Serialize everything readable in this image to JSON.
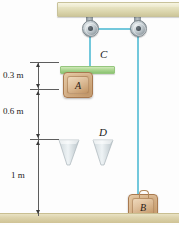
{
  "figure": {
    "domain": "physics-diagram"
  },
  "labels": {
    "block_a": "A",
    "block_b": "B",
    "platform_c": "C",
    "cone_d": "D"
  },
  "dimensions": [
    {
      "id": "d1",
      "text": "0.3 m",
      "value": 0.3,
      "unit": "m"
    },
    {
      "id": "d2",
      "text": "0.6 m",
      "value": 0.6,
      "unit": "m"
    },
    {
      "id": "d3",
      "text": "1 m",
      "value": 1.0,
      "unit": "m"
    }
  ],
  "colors": {
    "rope": "#73c8dc",
    "platform": "#aed793",
    "block_wood": "#d6b187",
    "beam": "#e6e2c0",
    "ground": "#ddd3ac",
    "pulley_metal": "#9aa3a8",
    "dimension_line": "#5d5d5d"
  },
  "parts": {
    "ceiling_beam": "ceiling-beam",
    "pulley_left": "pulley-left",
    "pulley_right": "pulley-right",
    "rope": "rope",
    "ground": "ground-surface"
  }
}
